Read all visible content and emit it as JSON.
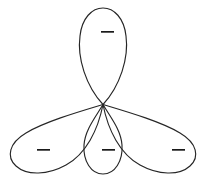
{
  "diagram": {
    "background_color": "#ffffff",
    "stroke_color": "#262626",
    "stroke_width": 1.15,
    "node": {
      "x": 103,
      "y": 104.5,
      "label": "central-node"
    },
    "canvas": {
      "width": 207,
      "height": 183
    },
    "lobes": [
      {
        "name": "top-lobe",
        "orientation": "up",
        "sign": "−",
        "sign_x": 101,
        "sign_y": 32,
        "sign_width": 13,
        "sign_height": 1.6,
        "tip_x": 103,
        "tip_y": 8,
        "extent_left_x": 78,
        "extent_right_x": 126,
        "path": "M 103 104.5 C 86 86 77 58 80 36 C 82 18 92 8 103 8 C 114 8 124 18 126 36 C 129 58 120 86 103 104.5 Z"
      },
      {
        "name": "bottom-left-lobe",
        "orientation": "down-left",
        "sign": "−",
        "sign_x": 37,
        "sign_y": 150,
        "sign_width": 13,
        "sign_height": 1.6,
        "tip_x": 9,
        "tip_y": 148,
        "path": "M 103 104.5 C 78 112 44 122 26 133 C 9 143 6 157 16 166 C 27 176 48 175 66 165 C 86 154 98 130 103 104.5 Z"
      },
      {
        "name": "bottom-center-lobe",
        "orientation": "down",
        "sign": "−",
        "sign_x": 102,
        "sign_y": 150,
        "sign_width": 13,
        "sign_height": 1.6,
        "tip_x": 103,
        "tip_y": 174,
        "extent_left_x": 84,
        "extent_right_x": 122,
        "path": "M 103 104.5 C 95 118 85 130 84 145 C 83 161 91 174 103 174 C 115 174 123 161 122 145 C 121 130 111 118 103 104.5 Z"
      },
      {
        "name": "bottom-right-lobe",
        "orientation": "down-right",
        "sign": "−",
        "sign_x": 172,
        "sign_y": 150,
        "sign_width": 13,
        "sign_height": 1.6,
        "tip_x": 198,
        "tip_y": 150,
        "path": "M 103 104.5 C 128 112 162 122 180 133 C 197 143 200 157 190 166 C 179 176 158 175 140 165 C 120 154 108 130 103 104.5 Z"
      }
    ]
  }
}
